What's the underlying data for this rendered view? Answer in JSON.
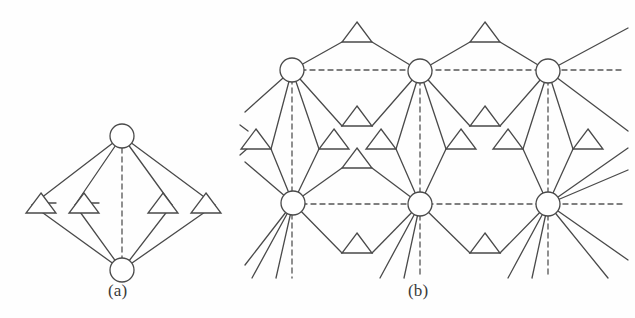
{
  "figure": {
    "kind": "two-panel-lattice-diagram",
    "background_color": "#fefefe",
    "stroke_color": "#4a4a4a",
    "node_fill_color": "#ffffff",
    "dash_color": "#555555",
    "line_width": 1.3,
    "dash_pattern": "5,4"
  },
  "panels": [
    {
      "id": "a",
      "caption": "(a)",
      "caption_x": 108,
      "caption_y": 281
    },
    {
      "id": "b",
      "caption": "(b)",
      "caption_x": 408,
      "caption_y": 281
    }
  ],
  "panel_a": {
    "caption": "(a)",
    "circles": [
      {
        "name": "top-vertex",
        "cx": 122,
        "cy": 136,
        "r": 12
      },
      {
        "name": "bottom-vertex",
        "cx": 122,
        "cy": 270,
        "r": 12
      }
    ],
    "triangles": [
      {
        "name": "triangle-1",
        "cx": 41,
        "cy": 203,
        "half_width": 15,
        "height": 20
      },
      {
        "name": "triangle-2",
        "cx": 84,
        "cy": 203,
        "half_width": 15,
        "height": 20
      },
      {
        "name": "triangle-3",
        "cx": 163,
        "cy": 203,
        "half_width": 15,
        "height": 20
      },
      {
        "name": "triangle-4",
        "cx": 206,
        "cy": 203,
        "half_width": 15,
        "height": 20
      }
    ],
    "solid_edges": [
      [
        122,
        136,
        32,
        205
      ],
      [
        122,
        136,
        75,
        205
      ],
      [
        122,
        136,
        172,
        205
      ],
      [
        122,
        136,
        215,
        205
      ],
      [
        122,
        270,
        32,
        205
      ],
      [
        122,
        270,
        75,
        205
      ],
      [
        122,
        270,
        172,
        205
      ],
      [
        122,
        270,
        215,
        205
      ],
      [
        41,
        203,
        56,
        203
      ],
      [
        84,
        203,
        99,
        203
      ]
    ],
    "dashed_edges": [
      [
        122,
        148,
        122,
        258
      ]
    ]
  },
  "panel_b": {
    "caption": "(b)",
    "circles": [
      {
        "name": "circle-top-left",
        "cx": 292,
        "cy": 70,
        "r": 12
      },
      {
        "name": "circle-top-mid",
        "cx": 420,
        "cy": 71,
        "r": 12
      },
      {
        "name": "circle-top-right",
        "cx": 548,
        "cy": 71,
        "r": 12
      },
      {
        "name": "circle-bottom-left",
        "cx": 293,
        "cy": 203,
        "r": 12
      },
      {
        "name": "circle-bottom-mid",
        "cx": 420,
        "cy": 204,
        "r": 12
      },
      {
        "name": "circle-bottom-right",
        "cx": 548,
        "cy": 204,
        "r": 12
      }
    ],
    "triangles": [
      {
        "name": "tri-top-1",
        "cx": 357,
        "cy": 32
      },
      {
        "name": "tri-top-2",
        "cx": 485,
        "cy": 32
      },
      {
        "name": "tri-mid-upper-1",
        "cx": 357,
        "cy": 116
      },
      {
        "name": "tri-mid-upper-2",
        "cx": 485,
        "cy": 116
      },
      {
        "name": "tri-band-1",
        "cx": 256,
        "cy": 139
      },
      {
        "name": "tri-band-2",
        "cx": 334,
        "cy": 139
      },
      {
        "name": "tri-band-3",
        "cx": 381,
        "cy": 139
      },
      {
        "name": "tri-band-4",
        "cx": 461,
        "cy": 139
      },
      {
        "name": "tri-band-5",
        "cx": 508,
        "cy": 139
      },
      {
        "name": "tri-band-6",
        "cx": 588,
        "cy": 139
      },
      {
        "name": "tri-mid-lower-1",
        "cx": 357,
        "cy": 158
      },
      {
        "name": "tri-bottom-1",
        "cx": 357,
        "cy": 243
      },
      {
        "name": "tri-bottom-2",
        "cx": 485,
        "cy": 243
      }
    ],
    "dashed_horizontal_lines": [
      {
        "name": "lattice-axis-top",
        "x1": 292,
        "x2": 625,
        "y": 70
      },
      {
        "name": "lattice-axis-bottom",
        "x1": 293,
        "x2": 625,
        "y": 204
      }
    ],
    "dashed_vertical_lines": [
      {
        "name": "lattice-axis-col-1",
        "x": 292,
        "y1": 70,
        "y2": 278
      },
      {
        "name": "lattice-axis-col-2",
        "x": 420,
        "y1": 71,
        "y2": 278
      },
      {
        "name": "lattice-axis-col-3",
        "x": 548,
        "y1": 71,
        "y2": 278
      }
    ]
  }
}
